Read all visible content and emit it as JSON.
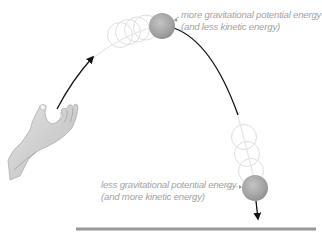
{
  "diagram": {
    "annotations": {
      "top": {
        "line1": "more gravitational potential energy",
        "line2": "(and less kinetic energy)"
      },
      "bottom": {
        "line1": "less gravitational potential energy",
        "line2": "(and more kinetic energy)"
      }
    },
    "elements": {
      "hand": "open-hand-icon",
      "ball_top": "ball-at-peak",
      "ball_bottom": "ball-near-ground",
      "ground": "ground-line",
      "trajectory": "parabolic-path"
    },
    "colors": {
      "ball": "#a8a8a8",
      "trajectory": "#1a1a1a",
      "ghost": "#dcdcdc",
      "ground": "#9a9a9a",
      "label_text": "#a2a2a2"
    }
  }
}
